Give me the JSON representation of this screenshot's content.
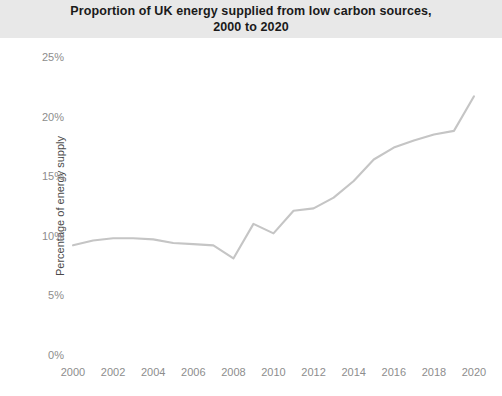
{
  "chart_data": {
    "type": "line",
    "title": "Proportion of UK energy supplied from low carbon sources,",
    "title_line2": "2000 to 2020",
    "xlabel": "",
    "ylabel": "Percentage of energy supply",
    "xlim": [
      2000,
      2020
    ],
    "ylim": [
      0,
      25
    ],
    "grid": false,
    "legend": "none",
    "xticks": [
      "2000",
      "2002",
      "2004",
      "2006",
      "2008",
      "2010",
      "2012",
      "2014",
      "2016",
      "2018",
      "2020"
    ],
    "xtick_values": [
      2000,
      2002,
      2004,
      2006,
      2008,
      2010,
      2012,
      2014,
      2016,
      2018,
      2020
    ],
    "yticks": [
      "0%",
      "5%",
      "10%",
      "15%",
      "20%",
      "25%"
    ],
    "ytick_values": [
      0,
      5,
      10,
      15,
      20,
      25
    ],
    "x": [
      2000,
      2001,
      2002,
      2003,
      2004,
      2005,
      2006,
      2007,
      2008,
      2009,
      2010,
      2011,
      2012,
      2013,
      2014,
      2015,
      2016,
      2017,
      2018,
      2019,
      2020
    ],
    "series": [
      {
        "name": "Low carbon share of UK energy supply",
        "color": "#c5c5c5",
        "values": [
          9.2,
          9.6,
          9.8,
          9.8,
          9.7,
          9.4,
          9.3,
          9.2,
          8.1,
          11.0,
          10.2,
          12.1,
          12.3,
          13.2,
          14.6,
          16.4,
          17.4,
          18.0,
          18.5,
          18.8,
          21.7
        ]
      }
    ]
  }
}
